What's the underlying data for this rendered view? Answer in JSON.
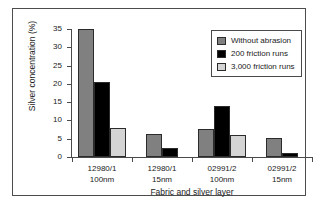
{
  "chart_data": {
    "type": "bar",
    "title": "",
    "xlabel": "Fabric and silver layer",
    "ylabel": "Silver concentration (%)",
    "ylim": [
      0,
      35
    ],
    "yticks": [
      0,
      5,
      10,
      15,
      20,
      25,
      30,
      35
    ],
    "ytick_labels": [
      "0",
      "5",
      "10",
      "15",
      "20",
      "25",
      "30",
      "35"
    ],
    "grid": false,
    "legend_position": "top-right",
    "categories": [
      "12980/1\n100nm",
      "12980/1\n15nm",
      "02991/2\n100nm",
      "02991/2\n15nm"
    ],
    "category_lines": [
      [
        "12980/1",
        "100nm"
      ],
      [
        "12980/1",
        "15nm"
      ],
      [
        "02991/2",
        "100nm"
      ],
      [
        "02991/2",
        "15nm"
      ]
    ],
    "series": [
      {
        "name": "Without abrasion",
        "color": "#808080",
        "values": [
          35.0,
          6.3,
          7.7,
          5.3
        ]
      },
      {
        "name": "200 friction runs",
        "color": "#000000",
        "values": [
          20.6,
          2.6,
          13.9,
          1.0
        ]
      },
      {
        "name": "3,000 friction runs",
        "color": "#d4d4d4",
        "values": [
          7.9,
          0,
          5.9,
          0
        ]
      }
    ]
  },
  "legend": {
    "items": [
      {
        "label": "Without abrasion",
        "color": "#808080"
      },
      {
        "label": "200 friction runs",
        "color": "#000000"
      },
      {
        "label": "3,000 friction runs",
        "color": "#d4d4d4"
      }
    ]
  },
  "axes": {
    "y_title": "Silver concentration (%)",
    "x_title": "Fabric and silver layer"
  }
}
